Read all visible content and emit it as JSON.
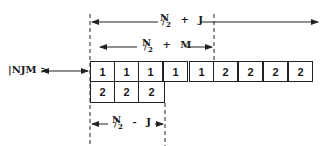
{
  "diagram": {
    "state_label": "|NJM >",
    "top_span": {
      "numerator": "N",
      "denominator": "2",
      "operator": "+",
      "term": "J"
    },
    "middle_span": {
      "numerator": "N",
      "denominator": "2",
      "operator": "+",
      "term": "M"
    },
    "bottom_span": {
      "numerator": "N",
      "denominator": "2",
      "operator": "-",
      "term": "J"
    },
    "row1": [
      "1",
      "1",
      "1",
      "1",
      "1",
      "2",
      "2",
      "2",
      "2"
    ],
    "row2": [
      "2",
      "2",
      "2"
    ],
    "colors": {
      "line": "#222222",
      "background": "#ffffff"
    }
  }
}
